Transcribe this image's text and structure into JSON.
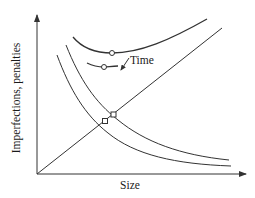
{
  "diagram": {
    "type": "conceptual-line-diagram",
    "x_axis_label": "Size",
    "y_axis_label": "Imperfections, penalties",
    "annotation": "Time",
    "colors": {
      "line": "#333333",
      "background": "#ffffff",
      "marker_fill": "#ffffff"
    },
    "elements": [
      {
        "name": "linear-penalty-line",
        "description": "straight line rising from origin with size"
      },
      {
        "name": "imperfection-curve-1",
        "description": "decreasing hyperbolic curve (inner)"
      },
      {
        "name": "imperfection-curve-2",
        "description": "decreasing hyperbolic curve (outer, shifted right with time)"
      },
      {
        "name": "total-curve-1",
        "description": "upper U-shaped total curve with circle minimum marker"
      },
      {
        "name": "total-curve-2",
        "description": "lower short U-shaped total curve with circle minimum marker"
      },
      {
        "name": "intersection-markers",
        "description": "two square markers where the linear line crosses the decreasing curves"
      },
      {
        "name": "time-arrow",
        "description": "arrow indicating shift of minimum over time"
      }
    ]
  }
}
